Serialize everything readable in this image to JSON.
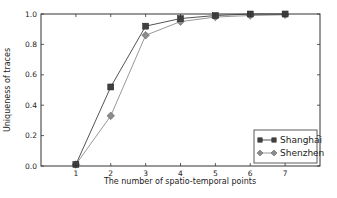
{
  "chart_data": {
    "type": "line",
    "title": "",
    "xlabel": "The number of spatio-temporal points",
    "ylabel": "Uniqueness of traces",
    "x": [
      1,
      2,
      3,
      4,
      5,
      6,
      7
    ],
    "xlim": [
      0,
      8
    ],
    "ylim": [
      0.0,
      1.0
    ],
    "xticks": [
      1,
      2,
      3,
      4,
      5,
      6,
      7
    ],
    "yticks": [
      0.0,
      0.2,
      0.4,
      0.6,
      0.8,
      1.0
    ],
    "ytick_labels": [
      "0.0",
      "0.2",
      "0.4",
      "0.6",
      "0.8",
      "1.0"
    ],
    "grid": false,
    "legend_position": "lower right",
    "series": [
      {
        "name": "Shanghai",
        "marker": "square",
        "color": "#404040",
        "values": [
          0.01,
          0.52,
          0.92,
          0.97,
          0.99,
          1.0,
          1.0
        ]
      },
      {
        "name": "Shenzhen",
        "marker": "diamond",
        "color": "#8c8c8c",
        "values": [
          0.01,
          0.33,
          0.86,
          0.95,
          0.98,
          0.99,
          0.995
        ]
      }
    ]
  }
}
